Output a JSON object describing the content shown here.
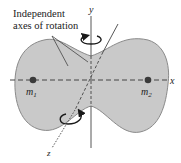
{
  "title_label": {
    "line1": "Independent",
    "line2": "axes of rotation"
  },
  "axes": {
    "x": "x",
    "y": "y",
    "z": "z"
  },
  "masses": [
    {
      "name": "m",
      "subscript": "1"
    },
    {
      "name": "m",
      "subscript": "2"
    }
  ],
  "colors": {
    "body_fill": "#c9c9c9",
    "body_stroke": "#8a8a8a",
    "axis": "#444444",
    "mass": "#3a3a3a",
    "arrow": "#1a1a1a"
  }
}
